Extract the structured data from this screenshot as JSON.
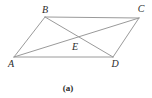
{
  "figure": {
    "type": "geometry-diagram",
    "shape": "parallelogram with both diagonals intersecting at center point",
    "caption": "(a)",
    "line_color": "#9a9a9a",
    "label_color": "#2b2b2b",
    "labels": {
      "a": "A",
      "b": "B",
      "c": "C",
      "d": "D",
      "e": "E"
    }
  }
}
